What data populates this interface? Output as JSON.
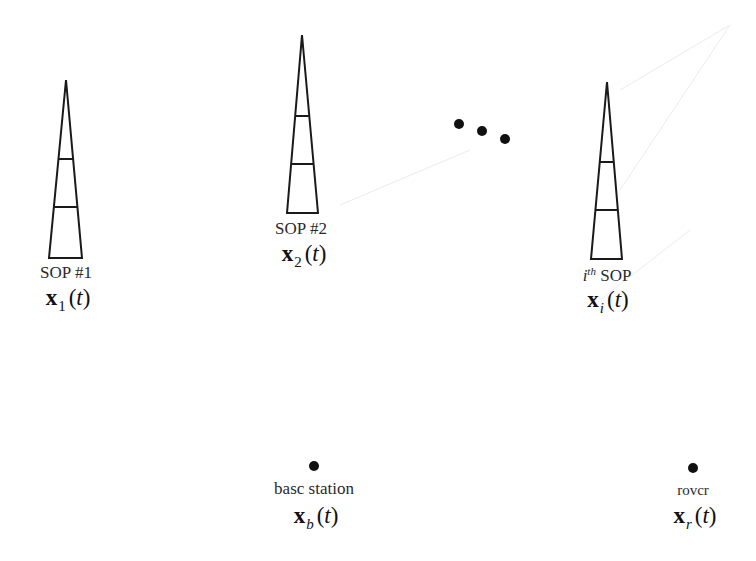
{
  "diagram": {
    "type": "positioning-scenario",
    "colors": {
      "stroke": "#1a1a1a",
      "background": "#ffffff",
      "faint_artifacts": "#e8e8e8"
    },
    "towers": [
      {
        "id": "sop-1",
        "name": "SOP #1",
        "symbol": "x",
        "subscript": "1",
        "argument": "t",
        "apex": [
          66,
          80
        ],
        "base_left": [
          49,
          258
        ],
        "base_right": [
          82,
          258
        ],
        "rungs_y": [
          159,
          207
        ]
      },
      {
        "id": "sop-2",
        "name": "SOP #2",
        "symbol": "x",
        "subscript": "2",
        "argument": "t",
        "apex": [
          302,
          35
        ],
        "base_left": [
          287,
          213
        ],
        "base_right": [
          318,
          213
        ],
        "rungs_y": [
          116,
          164
        ]
      },
      {
        "id": "sop-i",
        "name_prefix": "i",
        "name_superscript": "th",
        "name_suffix": "SOP",
        "symbol": "x",
        "subscript": "i",
        "argument": "t",
        "apex": [
          607,
          82
        ],
        "base_left": [
          591,
          259
        ],
        "base_right": [
          622,
          259
        ],
        "rungs_y": [
          162,
          210
        ]
      }
    ],
    "ellipsis_dots": [
      [
        459,
        124
      ],
      [
        482,
        131
      ],
      [
        505,
        139
      ]
    ],
    "receivers": [
      {
        "id": "base-station",
        "name": "basc station",
        "symbol": "x",
        "subscript": "b",
        "argument": "t",
        "dot": [
          314,
          466
        ]
      },
      {
        "id": "rover",
        "name": "rovcr",
        "symbol": "x",
        "subscript": "r",
        "argument": "t",
        "dot": [
          693,
          468
        ]
      }
    ],
    "paren_open": "(",
    "paren_close": ")"
  }
}
